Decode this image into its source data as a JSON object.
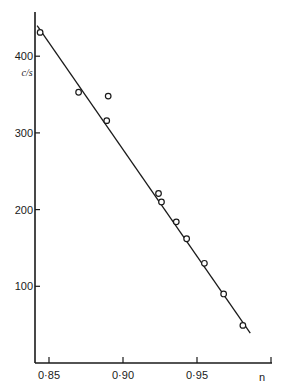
{
  "chart_data": {
    "type": "scatter",
    "title": "",
    "xlabel": "n",
    "ylabel": "c/s",
    "xlim": [
      0.845,
      1.0
    ],
    "ylim": [
      0,
      450
    ],
    "x_ticks": [
      0.85,
      0.9,
      0.95,
      1.0
    ],
    "x_tick_labels": [
      "0·85",
      "0·90",
      "0·95",
      ""
    ],
    "y_ticks": [
      100,
      200,
      300,
      400
    ],
    "y_tick_labels": [
      "100",
      "200",
      "300",
      "400"
    ],
    "grid": false,
    "legend": null,
    "series": [
      {
        "name": "measured points",
        "marker": "open-circle",
        "x": [
          0.844,
          0.87,
          0.89,
          0.889,
          0.924,
          0.926,
          0.936,
          0.943,
          0.955,
          0.968,
          0.981
        ],
        "y": [
          431,
          353,
          348,
          316,
          221,
          210,
          184,
          162,
          130,
          90,
          49
        ]
      },
      {
        "name": "fitted line",
        "style": "line",
        "x": [
          0.842,
          0.986
        ],
        "y": [
          440,
          39
        ]
      }
    ]
  },
  "axes": {
    "x_label": "n",
    "y_label": "c/s",
    "x_tick_labels": [
      "0·85",
      "0·90",
      "0·95"
    ],
    "y_tick_labels": [
      "400",
      "300",
      "200",
      "100"
    ]
  }
}
